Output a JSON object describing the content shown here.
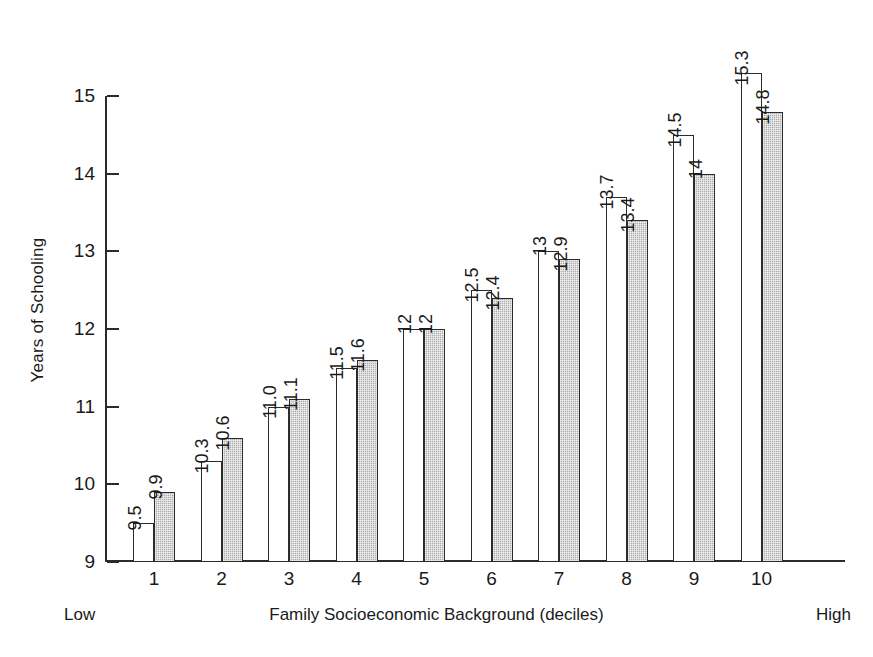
{
  "chart_data": {
    "type": "bar",
    "title": "",
    "xlabel": "Family Socioeconomic Background (deciles)",
    "ylabel": "Years of Schooling",
    "categories": [
      "1",
      "2",
      "3",
      "4",
      "5",
      "6",
      "7",
      "8",
      "9",
      "10"
    ],
    "ylim": [
      9,
      15
    ],
    "yticks": [
      "9",
      "10",
      "11",
      "12",
      "13",
      "14",
      "15"
    ],
    "grid": false,
    "legend": "none",
    "axis_endpoint_labels": {
      "left": "Low",
      "right": "High"
    },
    "series": [
      {
        "name": "series-white",
        "fill": "white",
        "values": [
          9.5,
          10.3,
          11.0,
          11.5,
          12.0,
          12.5,
          13.0,
          13.7,
          14.5,
          15.3
        ],
        "labels": [
          "9.5",
          "10.3",
          "11.0",
          "11.5",
          "12",
          "12.5",
          "13",
          "13.7",
          "14.5",
          "15.3"
        ]
      },
      {
        "name": "series-gray",
        "fill": "gray",
        "values": [
          9.9,
          10.6,
          11.1,
          11.6,
          12.0,
          12.4,
          12.9,
          13.4,
          14.0,
          14.8
        ],
        "labels": [
          "9.9",
          "10.6",
          "11.1",
          "11.6",
          "12",
          "12.4",
          "12.9",
          "13.4",
          "14",
          "14.8"
        ]
      }
    ]
  },
  "colors": {
    "axis": "#2b2b2b",
    "text": "#1a1a1a",
    "bar_white": "#ffffff",
    "bar_gray": "#adadad",
    "background": "#ffffff"
  }
}
